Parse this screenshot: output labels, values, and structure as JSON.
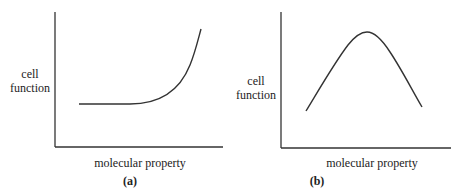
{
  "figures": [
    {
      "id": "a",
      "caption": "(a)",
      "ylabel_line1": "cell",
      "ylabel_line2": "function",
      "xlabel": "molecular property",
      "curve_shape": "flat then exponential rise"
    },
    {
      "id": "b",
      "caption": "(b)",
      "ylabel_line1": "cell",
      "ylabel_line2": "function",
      "xlabel": "molecular property",
      "curve_shape": "bell-shaped / peaked"
    }
  ],
  "colors": {
    "axis": "#333333",
    "curve": "#333333",
    "text": "#222222"
  }
}
